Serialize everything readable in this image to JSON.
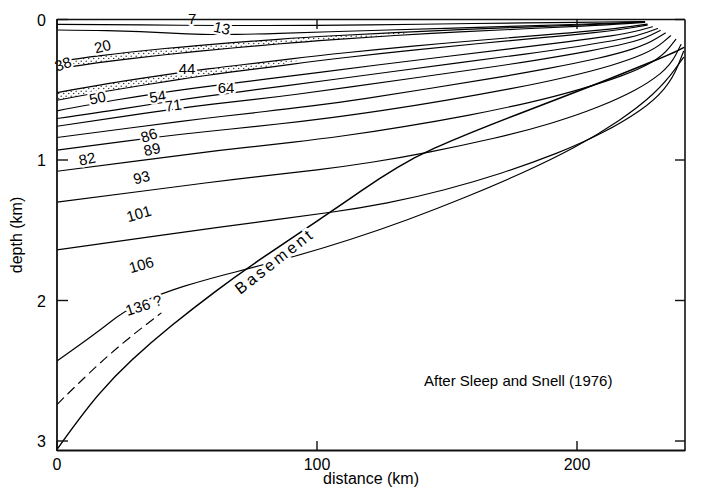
{
  "figure": {
    "caption": "After Sleep and Snell (1976)",
    "basement_label": "Basement"
  },
  "axes": {
    "x": {
      "label": "distance (km)",
      "ticks": [
        "0",
        "100",
        "200"
      ],
      "tick_values": [
        0,
        100,
        200
      ],
      "range": [
        0,
        241
      ]
    },
    "y": {
      "label": "depth (km)",
      "ticks": [
        "0",
        "1",
        "2",
        "3"
      ],
      "tick_values": [
        0,
        1,
        2,
        3
      ],
      "range": [
        0,
        3.06
      ]
    }
  },
  "chart_data": {
    "type": "line",
    "title": "",
    "subtitle": "",
    "xlabel": "distance (km)",
    "ylabel": "depth (km)",
    "xlim": [
      0,
      241
    ],
    "ylim": [
      3.06,
      0
    ],
    "grid": false,
    "legend": null,
    "y_axis_inverted": true,
    "annotations": [
      {
        "text": "After Sleep and Snell (1976)",
        "x": 148,
        "y": 2.57
      },
      {
        "text": "Basement",
        "x": 85,
        "y": 1.75,
        "rotated": true
      }
    ],
    "series": [
      {
        "name": "7",
        "label": "7",
        "kind": "isochron",
        "units": "Ma",
        "x": [
          0,
          10,
          25,
          40,
          55,
          70,
          90,
          110,
          130,
          150,
          170,
          190,
          210,
          226
        ],
        "y": [
          0.035,
          0.035,
          0.037,
          0.04,
          0.042,
          0.043,
          0.043,
          0.04,
          0.036,
          0.031,
          0.026,
          0.022,
          0.018,
          0.014
        ]
      },
      {
        "name": "13",
        "label": "13",
        "kind": "isochron",
        "units": "Ma",
        "x": [
          0,
          12,
          26,
          38,
          50,
          62,
          76,
          95,
          115,
          140,
          165,
          190,
          212,
          226
        ],
        "y": [
          0.075,
          0.077,
          0.082,
          0.09,
          0.103,
          0.108,
          0.104,
          0.093,
          0.082,
          0.068,
          0.054,
          0.04,
          0.027,
          0.016
        ]
      },
      {
        "name": "20",
        "label": "20",
        "kind": "isochron",
        "units": "Ma",
        "x": [
          0,
          10,
          22,
          35,
          48,
          60,
          75,
          95,
          118,
          142,
          168,
          192,
          212,
          226
        ],
        "y": [
          0.3,
          0.272,
          0.245,
          0.218,
          0.195,
          0.176,
          0.154,
          0.128,
          0.104,
          0.082,
          0.062,
          0.046,
          0.031,
          0.018
        ]
      },
      {
        "name": "38",
        "label": "38",
        "kind": "isochron",
        "units": "Ma",
        "stipple_top": true,
        "x": [
          0,
          10,
          22,
          35,
          48,
          60,
          75,
          95,
          118,
          142,
          168,
          192,
          212,
          226
        ],
        "y": [
          0.352,
          0.322,
          0.292,
          0.264,
          0.238,
          0.216,
          0.19,
          0.158,
          0.128,
          0.1,
          0.076,
          0.056,
          0.038,
          0.021
        ]
      },
      {
        "name": "44",
        "label": "44",
        "kind": "isochron",
        "units": "Ma",
        "x": [
          0,
          12,
          26,
          40,
          52,
          64,
          80,
          100,
          124,
          150,
          175,
          198,
          215,
          227
        ],
        "y": [
          0.52,
          0.48,
          0.437,
          0.398,
          0.366,
          0.337,
          0.303,
          0.258,
          0.212,
          0.167,
          0.128,
          0.094,
          0.065,
          0.033
        ]
      },
      {
        "name": "50",
        "label": "50",
        "kind": "isochron",
        "units": "Ma",
        "stipple_top": true,
        "x": [
          0,
          12,
          26,
          40,
          52,
          64,
          80,
          100,
          124,
          150,
          175,
          198,
          215,
          227
        ],
        "y": [
          0.575,
          0.533,
          0.489,
          0.447,
          0.412,
          0.381,
          0.344,
          0.294,
          0.243,
          0.193,
          0.149,
          0.11,
          0.077,
          0.04
        ]
      },
      {
        "name": "54",
        "label": "54",
        "kind": "isochron",
        "units": "Ma",
        "x": [
          0,
          14,
          30,
          45,
          58,
          72,
          90,
          112,
          136,
          162,
          186,
          206,
          220,
          229
        ],
        "y": [
          0.65,
          0.6,
          0.55,
          0.508,
          0.476,
          0.444,
          0.402,
          0.35,
          0.294,
          0.236,
          0.182,
          0.136,
          0.098,
          0.052
        ]
      },
      {
        "name": "64",
        "label": "64",
        "kind": "isochron",
        "units": "Ma",
        "x": [
          0,
          16,
          34,
          50,
          64,
          78,
          96,
          118,
          142,
          168,
          192,
          210,
          223,
          231
        ],
        "y": [
          0.705,
          0.663,
          0.61,
          0.565,
          0.53,
          0.496,
          0.452,
          0.398,
          0.338,
          0.276,
          0.216,
          0.164,
          0.118,
          0.064
        ]
      },
      {
        "name": "71",
        "label": "71",
        "kind": "isochron",
        "units": "Ma",
        "x": [
          0,
          16,
          34,
          52,
          68,
          84,
          102,
          124,
          148,
          174,
          196,
          213,
          225,
          232
        ],
        "y": [
          0.76,
          0.716,
          0.666,
          0.62,
          0.585,
          0.552,
          0.508,
          0.452,
          0.388,
          0.32,
          0.254,
          0.196,
          0.142,
          0.078
        ]
      },
      {
        "name": "86",
        "label": "86",
        "kind": "isochron",
        "units": "Ma",
        "x": [
          0,
          18,
          38,
          56,
          72,
          88,
          108,
          130,
          154,
          178,
          200,
          216,
          227,
          234
        ],
        "y": [
          0.84,
          0.796,
          0.748,
          0.706,
          0.672,
          0.638,
          0.592,
          0.53,
          0.46,
          0.386,
          0.31,
          0.242,
          0.176,
          0.096
        ]
      },
      {
        "name": "89",
        "label": "89",
        "kind": "isochron",
        "units": "Ma",
        "x": [
          0,
          18,
          38,
          58,
          76,
          94,
          114,
          138,
          162,
          186,
          206,
          220,
          230,
          236
        ],
        "y": [
          0.93,
          0.886,
          0.838,
          0.796,
          0.762,
          0.726,
          0.678,
          0.612,
          0.536,
          0.452,
          0.366,
          0.288,
          0.21,
          0.116
        ]
      },
      {
        "name": "93",
        "label": "93",
        "kind": "isochron",
        "units": "Ma",
        "x": [
          0,
          20,
          42,
          62,
          82,
          100,
          122,
          146,
          170,
          192,
          210,
          224,
          233,
          238
        ],
        "y": [
          1.08,
          1.032,
          0.98,
          0.932,
          0.892,
          0.854,
          0.798,
          0.724,
          0.64,
          0.546,
          0.448,
          0.354,
          0.258,
          0.142
        ]
      },
      {
        "name": "101",
        "label": "101",
        "kind": "isochron",
        "units": "Ma",
        "x": [
          0,
          22,
          46,
          68,
          90,
          110,
          132,
          156,
          180,
          200,
          216,
          228,
          236,
          240
        ],
        "y": [
          1.3,
          1.248,
          1.19,
          1.138,
          1.092,
          1.048,
          0.984,
          0.896,
          0.794,
          0.682,
          0.564,
          0.446,
          0.324,
          0.178
        ]
      },
      {
        "name": "106",
        "label": "106",
        "kind": "isochron",
        "units": "Ma",
        "x": [
          0,
          24,
          50,
          74,
          96,
          116,
          138,
          160,
          182,
          202,
          218,
          230,
          237,
          241
        ],
        "y": [
          1.64,
          1.578,
          1.51,
          1.45,
          1.396,
          1.344,
          1.266,
          1.158,
          1.026,
          0.88,
          0.726,
          0.572,
          0.414,
          0.226
        ]
      },
      {
        "name": "136 ?",
        "label": "136 ?",
        "kind": "isochron",
        "units": "Ma",
        "x": [
          0,
          14,
          26,
          40,
          58,
          80,
          102,
          124,
          146,
          168,
          190,
          208,
          224,
          234,
          241
        ],
        "y": [
          2.43,
          2.248,
          2.072,
          1.95,
          1.846,
          1.744,
          1.63,
          1.498,
          1.348,
          1.182,
          1.0,
          0.82,
          0.62,
          0.448,
          0.27
        ]
      },
      {
        "name": "basement",
        "label": "Basement",
        "kind": "basement",
        "x": [
          0,
          10,
          22,
          36,
          52,
          70,
          90,
          110,
          124,
          138,
          152,
          168,
          186,
          205,
          222,
          236,
          241
        ],
        "y": [
          3.06,
          2.8,
          2.54,
          2.3,
          2.06,
          1.81,
          1.56,
          1.31,
          1.13,
          0.975,
          0.86,
          0.74,
          0.612,
          0.478,
          0.352,
          0.246,
          0.2
        ]
      },
      {
        "name": "basement-dashed-branch",
        "label": "",
        "kind": "basement-inferred",
        "dashed": true,
        "x": [
          0,
          12,
          26,
          40
        ],
        "y": [
          2.74,
          2.52,
          2.29,
          2.09
        ]
      }
    ],
    "stipple_bands": [
      {
        "name": "upper-sand-wedge",
        "top_series": "20",
        "bottom_series": "38",
        "x": [
          0,
          10,
          22,
          35,
          48,
          60,
          75,
          95,
          118,
          135
        ],
        "y_top": [
          0.3,
          0.272,
          0.245,
          0.218,
          0.195,
          0.176,
          0.154,
          0.128,
          0.104,
          0.092
        ],
        "y_bottom": [
          0.352,
          0.322,
          0.292,
          0.264,
          0.238,
          0.216,
          0.19,
          0.158,
          0.128,
          0.098
        ]
      },
      {
        "name": "lower-sand-wedge",
        "top_series": "44",
        "bottom_series": "50",
        "x": [
          0,
          12,
          26,
          40,
          52,
          64,
          80,
          94
        ],
        "y_top": [
          0.52,
          0.48,
          0.437,
          0.398,
          0.366,
          0.337,
          0.303,
          0.282
        ],
        "y_bottom": [
          0.575,
          0.533,
          0.489,
          0.447,
          0.412,
          0.381,
          0.344,
          0.29
        ]
      }
    ],
    "label_positions": [
      {
        "text": "7",
        "x": 52,
        "y": 0.03,
        "rotate": 0
      },
      {
        "text": "13",
        "x": 63,
        "y": 0.098,
        "rotate": 12
      },
      {
        "text": "20",
        "x": 18,
        "y": 0.228,
        "rotate": -14
      },
      {
        "text": "38",
        "x": 3,
        "y": 0.352,
        "rotate": -20
      },
      {
        "text": "44",
        "x": 50,
        "y": 0.39,
        "rotate": 0
      },
      {
        "text": "50",
        "x": 16,
        "y": 0.595,
        "rotate": -12
      },
      {
        "text": "54",
        "x": 39,
        "y": 0.585,
        "rotate": -9
      },
      {
        "text": "64",
        "x": 65,
        "y": 0.52,
        "rotate": 0
      },
      {
        "text": "71",
        "x": 45,
        "y": 0.648,
        "rotate": -8
      },
      {
        "text": "86",
        "x": 36,
        "y": 0.86,
        "rotate": -18
      },
      {
        "text": "89",
        "x": 37,
        "y": 0.96,
        "rotate": -13
      },
      {
        "text": "93",
        "x": 33,
        "y": 1.16,
        "rotate": -14
      },
      {
        "text": "101",
        "x": 32,
        "y": 1.418,
        "rotate": -16
      },
      {
        "text": "106",
        "x": 33,
        "y": 1.782,
        "rotate": -16
      },
      {
        "text": "136 ?",
        "x": 34,
        "y": 2.07,
        "rotate": -18
      },
      {
        "text": "82",
        "x": 12,
        "y": 1.028,
        "rotate": -12
      }
    ]
  },
  "colors": {
    "line": "#000000",
    "axis": "#1a1a1a",
    "background": "#ffffff",
    "stipple": "#444444"
  }
}
